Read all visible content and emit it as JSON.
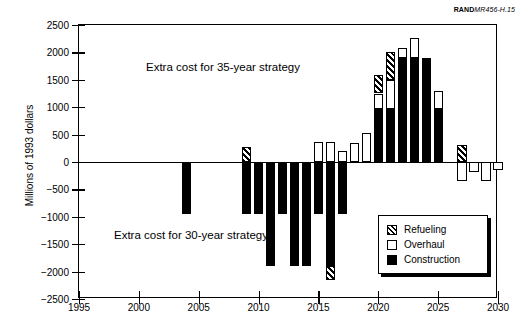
{
  "credit": {
    "brand": "RAND",
    "number": "MR456-H.15"
  },
  "chart_data": {
    "type": "bar",
    "title": "",
    "xlabel": "",
    "ylabel": "Millions of 1993 dollars",
    "xlim": [
      1995,
      2030
    ],
    "ylim": [
      -2500,
      2500
    ],
    "xticks": [
      1995,
      2000,
      2005,
      2010,
      2015,
      2020,
      2025,
      2030
    ],
    "yticks": [
      2500,
      2000,
      1500,
      1000,
      500,
      0,
      -500,
      -1000,
      -1500,
      -2000,
      -2500
    ],
    "grid": false,
    "stacked": true,
    "legend_position": "bottom-right",
    "legend": [
      {
        "key": "refueling",
        "label": "Refueling"
      },
      {
        "key": "overhaul",
        "label": "Overhaul"
      },
      {
        "key": "construction",
        "label": "Construction"
      }
    ],
    "categories": [
      2004,
      2009,
      2010,
      2011,
      2012,
      2013,
      2014,
      2015,
      2016,
      2017,
      2018,
      2019,
      2020,
      2021,
      2022,
      2023,
      2024,
      2025,
      2027,
      2028,
      2029,
      2030
    ],
    "series": [
      {
        "name": "Construction",
        "values": [
          -950,
          -950,
          -950,
          -1900,
          -950,
          -1900,
          -1900,
          -950,
          -1900,
          -950,
          0,
          0,
          975,
          975,
          1900,
          1900,
          1900,
          975,
          0,
          0,
          0,
          0
        ]
      },
      {
        "name": "Overhaul",
        "values": [
          0,
          0,
          0,
          0,
          0,
          0,
          0,
          365,
          365,
          195,
          355,
          530,
          275,
          525,
          180,
          370,
          0,
          320,
          -345,
          -175,
          -340,
          -140
        ]
      },
      {
        "name": "Refueling",
        "values": [
          0,
          280,
          0,
          0,
          0,
          0,
          0,
          0,
          -250,
          0,
          0,
          0,
          330,
          510,
          0,
          0,
          0,
          0,
          305,
          0,
          0,
          0
        ]
      }
    ],
    "bars": [
      {
        "year": 2004,
        "segments": [
          {
            "type": "construction",
            "from": 0,
            "to": -950
          }
        ]
      },
      {
        "year": 2009,
        "segments": [
          {
            "type": "construction",
            "from": 0,
            "to": -950
          },
          {
            "type": "refueling",
            "from": 0,
            "to": 280
          }
        ]
      },
      {
        "year": 2010,
        "segments": [
          {
            "type": "construction",
            "from": 0,
            "to": -950
          }
        ]
      },
      {
        "year": 2011,
        "segments": [
          {
            "type": "construction",
            "from": 0,
            "to": -1900
          }
        ]
      },
      {
        "year": 2012,
        "segments": [
          {
            "type": "construction",
            "from": 0,
            "to": -950
          }
        ]
      },
      {
        "year": 2013,
        "segments": [
          {
            "type": "construction",
            "from": 0,
            "to": -1900
          }
        ]
      },
      {
        "year": 2014,
        "segments": [
          {
            "type": "construction",
            "from": 0,
            "to": -1900
          }
        ]
      },
      {
        "year": 2015,
        "segments": [
          {
            "type": "construction",
            "from": 0,
            "to": -950
          },
          {
            "type": "overhaul",
            "from": 0,
            "to": 365
          }
        ]
      },
      {
        "year": 2016,
        "segments": [
          {
            "type": "construction",
            "from": 0,
            "to": -1900
          },
          {
            "type": "refueling",
            "from": -1900,
            "to": -2150
          },
          {
            "type": "overhaul",
            "from": 0,
            "to": 365
          }
        ]
      },
      {
        "year": 2017,
        "segments": [
          {
            "type": "construction",
            "from": 0,
            "to": -950
          },
          {
            "type": "overhaul",
            "from": 0,
            "to": 195
          }
        ]
      },
      {
        "year": 2018,
        "segments": [
          {
            "type": "overhaul",
            "from": 0,
            "to": 355
          }
        ]
      },
      {
        "year": 2019,
        "segments": [
          {
            "type": "overhaul",
            "from": 0,
            "to": 530
          }
        ]
      },
      {
        "year": 2020,
        "segments": [
          {
            "type": "construction",
            "from": 0,
            "to": 975
          },
          {
            "type": "overhaul",
            "from": 975,
            "to": 1250
          },
          {
            "type": "refueling",
            "from": 1250,
            "to": 1580
          }
        ]
      },
      {
        "year": 2021,
        "segments": [
          {
            "type": "construction",
            "from": 0,
            "to": 975
          },
          {
            "type": "overhaul",
            "from": 975,
            "to": 1500
          },
          {
            "type": "refueling",
            "from": 1500,
            "to": 2010
          }
        ]
      },
      {
        "year": 2022,
        "segments": [
          {
            "type": "construction",
            "from": 0,
            "to": 1900
          },
          {
            "type": "overhaul",
            "from": 1900,
            "to": 2080
          }
        ]
      },
      {
        "year": 2023,
        "segments": [
          {
            "type": "construction",
            "from": 0,
            "to": 1900
          },
          {
            "type": "overhaul",
            "from": 1900,
            "to": 2270
          }
        ]
      },
      {
        "year": 2024,
        "segments": [
          {
            "type": "construction",
            "from": 0,
            "to": 1900
          }
        ]
      },
      {
        "year": 2025,
        "segments": [
          {
            "type": "construction",
            "from": 0,
            "to": 975
          },
          {
            "type": "overhaul",
            "from": 975,
            "to": 1295
          }
        ]
      },
      {
        "year": 2027,
        "segments": [
          {
            "type": "refueling",
            "from": 0,
            "to": 305
          },
          {
            "type": "overhaul",
            "from": 0,
            "to": -345
          }
        ]
      },
      {
        "year": 2028,
        "segments": [
          {
            "type": "overhaul",
            "from": 0,
            "to": -175
          }
        ]
      },
      {
        "year": 2029,
        "segments": [
          {
            "type": "overhaul",
            "from": 0,
            "to": -340
          }
        ]
      },
      {
        "year": 2030,
        "segments": [
          {
            "type": "overhaul",
            "from": 0,
            "to": -140
          }
        ]
      }
    ],
    "annotations": [
      {
        "id": "anno35",
        "text": "Extra cost for 35-year strategy"
      },
      {
        "id": "anno30",
        "text": "Extra cost for 30-year strategy"
      }
    ]
  }
}
